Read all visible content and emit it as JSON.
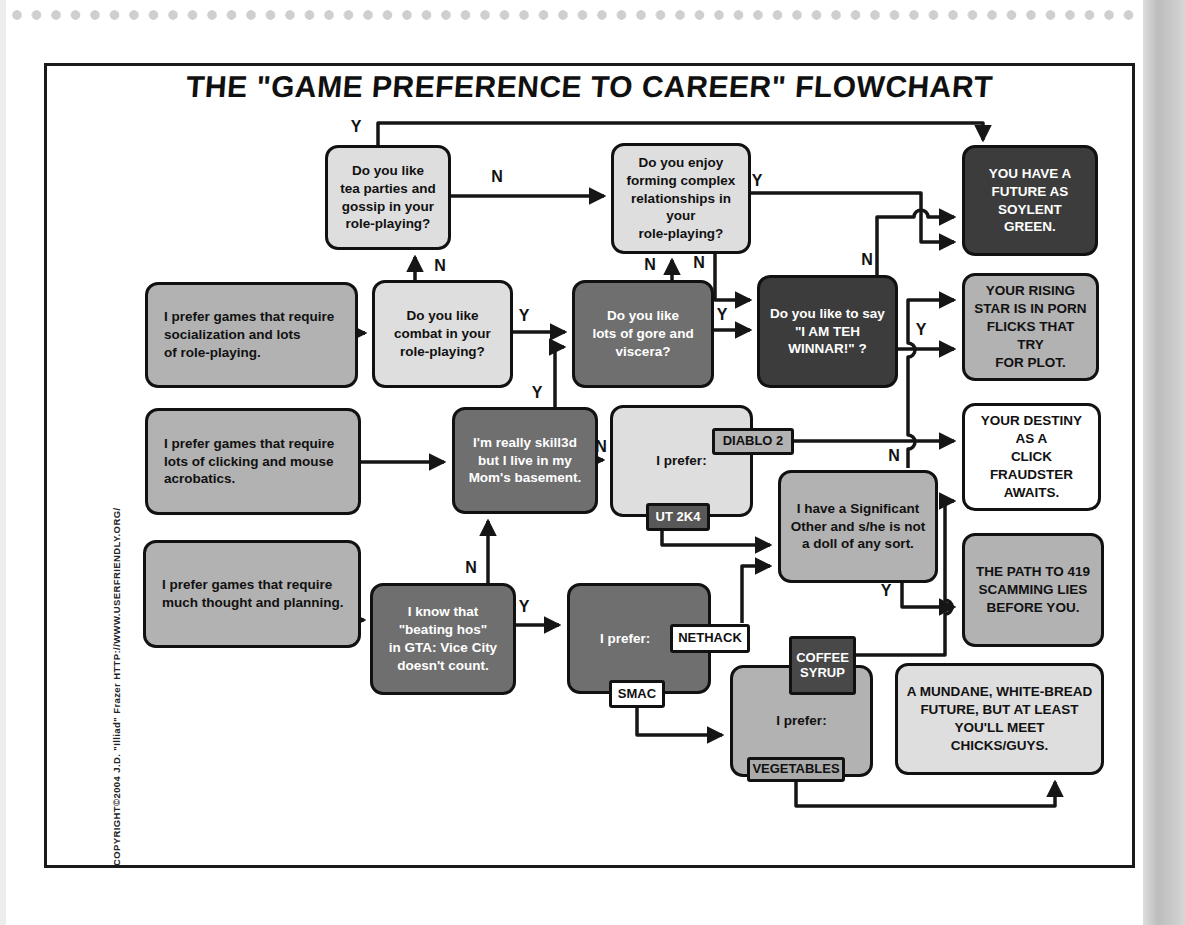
{
  "page": {
    "title": "THE \"GAME PREFERENCE TO CAREER\" FLOWCHART",
    "copyright": "COPYRIGHT©2004 J.D. \"Illiad\" Frazer   HTTP://WWW.USERFRIENDLY.ORG/"
  },
  "colors": {
    "frame_border": "#1a1a1a",
    "line": "#161616",
    "page_bg": "#ffffff",
    "scan_bar": "#c6c6c6",
    "dots": "#cfcfcf",
    "node_styles": {
      "light": {
        "bg": "#dedede",
        "fg": "#111111"
      },
      "mid": {
        "bg": "#b2b2b2",
        "fg": "#111111"
      },
      "dark": {
        "bg": "#6f6f6f",
        "fg": "#ffffff"
      },
      "black": {
        "bg": "#3c3c3c",
        "fg": "#ffffff"
      },
      "white": {
        "bg": "#ffffff",
        "fg": "#111111"
      }
    }
  },
  "flow": {
    "nodes": [
      {
        "id": "tea-parties",
        "text": "Do you like\ntea parties and\ngossip in your\nrole-playing?",
        "x": 325,
        "y": 145,
        "w": 126,
        "h": 105,
        "style": "light",
        "align": "center"
      },
      {
        "id": "forming-relationships",
        "text": "Do you enjoy\nforming complex\nrelationships in your\nrole-playing?",
        "x": 611,
        "y": 143,
        "w": 140,
        "h": 111,
        "style": "light",
        "align": "center"
      },
      {
        "id": "soylent-green",
        "text": "YOU HAVE A\nFUTURE AS\nSOYLENT\nGREEN.",
        "x": 962,
        "y": 145,
        "w": 136,
        "h": 111,
        "style": "black",
        "align": "center"
      },
      {
        "id": "prefer-socialization",
        "text": "I prefer games that require\nsocialization and lots\nof role-playing.",
        "x": 145,
        "y": 282,
        "w": 213,
        "h": 106,
        "style": "mid",
        "align": "left"
      },
      {
        "id": "combat",
        "text": "Do you like\ncombat in your\nrole-playing?",
        "x": 372,
        "y": 280,
        "w": 141,
        "h": 108,
        "style": "light",
        "align": "center"
      },
      {
        "id": "gore",
        "text": "Do you like\nlots of gore and\nviscera?",
        "x": 572,
        "y": 280,
        "w": 142,
        "h": 108,
        "style": "dark",
        "align": "center"
      },
      {
        "id": "winnar",
        "text": "Do you like to say\n\"I AM TEH\nWINNAR!\" ?",
        "x": 757,
        "y": 275,
        "w": 141,
        "h": 113,
        "style": "black",
        "align": "center"
      },
      {
        "id": "porn-flicks",
        "text": "YOUR RISING\nSTAR IS IN PORN\nFLICKS THAT TRY\nFOR PLOT.",
        "x": 962,
        "y": 273,
        "w": 137,
        "h": 108,
        "style": "mid",
        "align": "center"
      },
      {
        "id": "prefer-clicking",
        "text": "I prefer games that require\nlots of clicking and mouse\nacrobatics.",
        "x": 145,
        "y": 408,
        "w": 216,
        "h": 107,
        "style": "mid",
        "align": "left"
      },
      {
        "id": "skill3d",
        "text": "I'm really skill3d\nbut I live in my\nMom's basement.",
        "x": 452,
        "y": 407,
        "w": 146,
        "h": 107,
        "style": "dark",
        "align": "center"
      },
      {
        "id": "prefer-diablo-ut",
        "text": "I prefer:",
        "x": 610,
        "y": 405,
        "w": 143,
        "h": 112,
        "style": "light",
        "align": "center"
      },
      {
        "id": "significant-other",
        "text": "I have a Significant\nOther and s/he is not\na doll of any sort.",
        "x": 778,
        "y": 470,
        "w": 160,
        "h": 113,
        "style": "mid",
        "align": "center"
      },
      {
        "id": "click-fraudster",
        "text": "YOUR DESTINY\nAS A\nCLICK FRAUDSTER\nAWAITS.",
        "x": 962,
        "y": 403,
        "w": 139,
        "h": 108,
        "style": "white",
        "align": "center"
      },
      {
        "id": "prefer-thought",
        "text": "I prefer games that require\nmuch thought and planning.",
        "x": 143,
        "y": 540,
        "w": 218,
        "h": 108,
        "style": "mid",
        "align": "left"
      },
      {
        "id": "gta-vice-city",
        "text": "I know that\n\"beating hos\"\nin GTA: Vice City\ndoesn't count.",
        "x": 370,
        "y": 583,
        "w": 146,
        "h": 112,
        "style": "dark",
        "align": "center"
      },
      {
        "id": "prefer-nethack-smac",
        "text": "I prefer:",
        "x": 567,
        "y": 583,
        "w": 144,
        "h": 111,
        "style": "dark",
        "align": "shift"
      },
      {
        "id": "path-419",
        "text": "THE PATH TO 419\nSCAMMING LIES\nBEFORE YOU.",
        "x": 962,
        "y": 533,
        "w": 142,
        "h": 114,
        "style": "mid",
        "align": "center"
      },
      {
        "id": "prefer-coffee-veg",
        "text": "I prefer:",
        "x": 730,
        "y": 665,
        "w": 143,
        "h": 112,
        "style": "mid",
        "align": "center"
      },
      {
        "id": "mundane-future",
        "text": "A MUNDANE, WHITE-BREAD\nFUTURE, BUT AT LEAST\nYOU'LL MEET CHICKS/GUYS.",
        "x": 895,
        "y": 663,
        "w": 209,
        "h": 112,
        "style": "light",
        "align": "center"
      }
    ],
    "tags": [
      {
        "id": "diablo2",
        "text": "DIABLO 2",
        "x": 712,
        "y": 428,
        "w": 82,
        "h": 27,
        "bg": "#b2b2b2",
        "fg": "#111111"
      },
      {
        "id": "ut2k4",
        "text": "UT 2K4",
        "x": 646,
        "y": 503,
        "w": 64,
        "h": 28,
        "bg": "#585858",
        "fg": "#ffffff"
      },
      {
        "id": "nethack",
        "text": "NETHACK",
        "x": 670,
        "y": 624,
        "w": 80,
        "h": 29,
        "bg": "#ffffff",
        "fg": "#111111"
      },
      {
        "id": "smac",
        "text": "SMAC",
        "x": 609,
        "y": 680,
        "w": 56,
        "h": 28,
        "bg": "#ffffff",
        "fg": "#111111"
      },
      {
        "id": "coffee-syrup",
        "text": "COFFEE\nSYRUP",
        "x": 789,
        "y": 636,
        "w": 67,
        "h": 59,
        "bg": "#484848",
        "fg": "#ffffff"
      },
      {
        "id": "vegetables",
        "text": "VEGETABLES",
        "x": 747,
        "y": 757,
        "w": 98,
        "h": 25,
        "bg": "#aaaaaa",
        "fg": "#111111"
      }
    ],
    "labels": [
      {
        "t": "Y",
        "x": 356,
        "y": 127
      },
      {
        "t": "N",
        "x": 497,
        "y": 177
      },
      {
        "t": "N",
        "x": 440,
        "y": 266
      },
      {
        "t": "Y",
        "x": 524,
        "y": 316
      },
      {
        "t": "N",
        "x": 650,
        "y": 265
      },
      {
        "t": "N",
        "x": 699,
        "y": 263
      },
      {
        "t": "Y",
        "x": 722,
        "y": 315
      },
      {
        "t": "Y",
        "x": 757,
        "y": 181
      },
      {
        "t": "N",
        "x": 867,
        "y": 260
      },
      {
        "t": "Y",
        "x": 921,
        "y": 330
      },
      {
        "t": "N",
        "x": 894,
        "y": 456
      },
      {
        "t": "N",
        "x": 601,
        "y": 447
      },
      {
        "t": "Y",
        "x": 537,
        "y": 393
      },
      {
        "t": "N",
        "x": 471,
        "y": 568
      },
      {
        "t": "Y",
        "x": 524,
        "y": 607
      },
      {
        "t": "Y",
        "x": 886,
        "y": 591
      }
    ],
    "edges": [
      {
        "from": "prefer-socialization",
        "to": "combat",
        "label": "",
        "path": "M357,333 H365"
      },
      {
        "from": "combat",
        "to": "gore",
        "label": "Y",
        "path": "M512,332 H565"
      },
      {
        "from": "combat",
        "to": "tea-parties",
        "label": "N",
        "path": "M415,280 V257"
      },
      {
        "from": "tea-parties",
        "to": "soylent-green",
        "label": "Y",
        "path": "M378,145 V123 H983 V140"
      },
      {
        "from": "tea-parties",
        "to": "forming-relationships",
        "label": "N",
        "path": "M450,196 H604"
      },
      {
        "from": "gore",
        "to": "forming-relationships",
        "label": "N",
        "path": "M672,280 V260"
      },
      {
        "from": "forming-relationships",
        "to": "winnar",
        "label": "N",
        "path": "M715,253 V300 H750"
      },
      {
        "from": "gore",
        "to": "winnar",
        "label": "Y",
        "path": "M713,330 H750"
      },
      {
        "from": "forming-relationships",
        "to": "soylent-green",
        "label": "Y",
        "path": "M750,193 H921 V242 H954"
      },
      {
        "from": "winnar",
        "to": "soylent-green",
        "label": "N",
        "path": "M877,277 V217 H914 A7 7 0 0 1 928,217 H954"
      },
      {
        "from": "winnar",
        "to": "porn-flicks",
        "label": "Y",
        "path": "M897,349 H954"
      },
      {
        "from": "significant-other",
        "to": "porn-flicks",
        "label": "N",
        "path": "M908,468 V449 A7 7 0 0 0 908,435 V357 A7 7 0 0 0 908,343 V300 H954"
      },
      {
        "from": "diablo2",
        "to": "click-fraudster",
        "label": "",
        "path": "M793,441 H954"
      },
      {
        "from": "ut2k4",
        "to": "significant-other",
        "label": "",
        "path": "M662,531 V545 H770"
      },
      {
        "from": "nethack",
        "to": "significant-other",
        "label": "",
        "path": "M742,623 V566 H770"
      },
      {
        "from": "skill3d",
        "to": "prefer-diablo-ut",
        "label": "N",
        "path": "M597,460 H603"
      },
      {
        "from": "skill3d",
        "to": "gore",
        "label": "Y",
        "path": "M555,407 V347 H564"
      },
      {
        "from": "prefer-clicking",
        "to": "skill3d",
        "label": "",
        "path": "M360,462 H444"
      },
      {
        "from": "gta-vice-city",
        "to": "skill3d",
        "label": "N",
        "path": "M488,583 V521"
      },
      {
        "from": "prefer-thought",
        "to": "gta-vice-city",
        "label": "",
        "path": "M361,620 H364"
      },
      {
        "from": "gta-vice-city",
        "to": "prefer-nethack-smac",
        "label": "Y",
        "path": "M515,625 H559"
      },
      {
        "from": "smac",
        "to": "prefer-coffee-veg",
        "label": "",
        "path": "M637,708 V735 H722"
      },
      {
        "from": "coffee-syrup",
        "to": "click-fraudster",
        "label": "",
        "path": "M856,655 H945 V614 A7 7 0 0 0 945,600 V501 H954"
      },
      {
        "from": "significant-other",
        "to": "path-419",
        "label": "Y",
        "path": "M902,582 V607 H954"
      },
      {
        "from": "vegetables",
        "to": "mundane-future",
        "label": "",
        "path": "M796,782 V806 H1055 V782"
      }
    ]
  }
}
